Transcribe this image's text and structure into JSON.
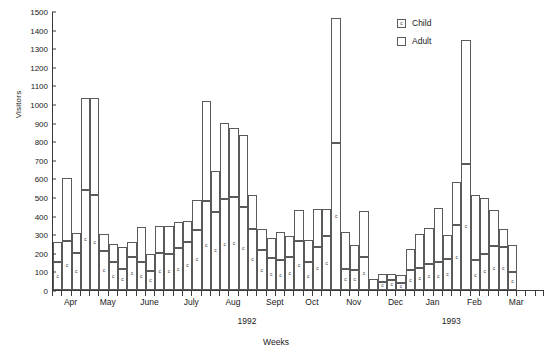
{
  "chart_data": {
    "type": "bar",
    "subtype": "stacked-vertical",
    "title": "",
    "xlabel": "Weeks",
    "ylabel": "Visitors",
    "ylim": [
      0,
      1500
    ],
    "ytick_step": 100,
    "yticks": [
      0,
      100,
      200,
      300,
      400,
      500,
      600,
      700,
      800,
      900,
      1000,
      1100,
      1200,
      1300,
      1400,
      1500
    ],
    "grid": false,
    "legend_position": "top-right",
    "legend": [
      {
        "name": "Child",
        "marker": "c",
        "fill": "#ffffff",
        "stroke": "#5a5a5a"
      },
      {
        "name": "Adult",
        "marker": "",
        "fill": "#ffffff",
        "stroke": "#5a5a5a"
      }
    ],
    "x_tick_labels": [
      "Apr",
      "May",
      "June",
      "July",
      "Aug",
      "Sept",
      "Oct",
      "Nov",
      "Dec",
      "Jan",
      "Feb",
      "Mar"
    ],
    "x_group_labels": [
      {
        "label": "1992",
        "center_week": 21
      },
      {
        "label": "1993",
        "center_week": 43
      }
    ],
    "month_tick_centers": [
      2,
      6,
      10.5,
      15,
      19.5,
      24,
      28,
      32.5,
      37,
      41,
      45.5,
      50
    ],
    "n_bars": 53,
    "series": [
      {
        "name": "Child",
        "values": [
          150,
          265,
          200,
          540,
          510,
          210,
          150,
          115,
          180,
          150,
          100,
          200,
          195,
          225,
          260,
          325,
          480,
          420,
          490,
          500,
          445,
          330,
          215,
          170,
          160,
          175,
          265,
          150,
          230,
          290,
          790,
          115,
          110,
          180,
          0,
          45,
          55,
          40,
          105,
          120,
          140,
          150,
          165,
          350,
          680,
          160,
          195,
          235,
          230,
          95,
          0,
          0,
          0
        ]
      },
      {
        "name": "Adult",
        "values": [
          110,
          335,
          105,
          490,
          520,
          90,
          95,
          115,
          80,
          190,
          95,
          145,
          150,
          140,
          110,
          160,
          535,
          220,
          410,
          370,
          390,
          180,
          115,
          110,
          150,
          115,
          165,
          120,
          205,
          145,
          670,
          195,
          130,
          245,
          60,
          40,
          30,
          40,
          115,
          180,
          195,
          290,
          130,
          230,
          665,
          350,
          300,
          195,
          100,
          145,
          0,
          0,
          0
        ]
      }
    ],
    "totals": [
      260,
      600,
      305,
      1030,
      1030,
      300,
      245,
      230,
      260,
      340,
      195,
      345,
      345,
      365,
      370,
      485,
      1015,
      640,
      900,
      870,
      835,
      510,
      330,
      280,
      310,
      290,
      430,
      270,
      435,
      435,
      1460,
      310,
      240,
      425,
      60,
      85,
      85,
      80,
      220,
      300,
      335,
      440,
      295,
      580,
      1345,
      510,
      495,
      430,
      330,
      240,
      0,
      0,
      0
    ]
  },
  "axis": {
    "y_title": "Visitors",
    "x_title": "Weeks"
  }
}
